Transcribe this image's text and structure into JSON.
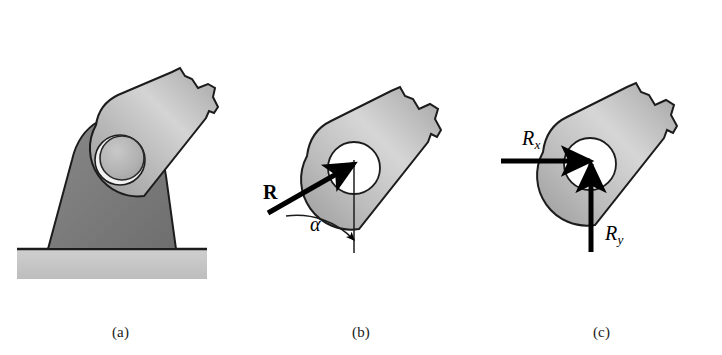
{
  "figure": {
    "background_color": "#ffffff",
    "panels": [
      {
        "id": "a",
        "caption": "(a)",
        "description": "Bar pinned to a bracket mounted on ground",
        "parts": [
          "bar",
          "bracket",
          "pin",
          "ground"
        ]
      },
      {
        "id": "b",
        "caption": "(b)",
        "description": "Free-body diagram of bar with resultant pin reaction R at angle alpha from vertical",
        "parts": [
          "bar",
          "pin-hole",
          "resultant-force-arrow",
          "vertical-reference-line",
          "angle-arc"
        ]
      },
      {
        "id": "c",
        "caption": "(c)",
        "description": "Free-body diagram of bar with rectangular components Rx and Ry of the pin reaction",
        "parts": [
          "bar",
          "pin-hole",
          "rx-arrow",
          "ry-arrow"
        ]
      }
    ]
  },
  "labels": {
    "resultant": "R",
    "angle": "α",
    "component_x_base": "R",
    "component_x_sub": "x",
    "component_y_base": "R",
    "component_y_sub": "y"
  },
  "colors": {
    "bar_light": "#d2d2d2",
    "bar_mid": "#a9a9a9",
    "bar_dark": "#8e8e8e",
    "bracket": "#7d7d7d",
    "ground": "#c8c8c8",
    "outline": "#1c1c1c",
    "arrow": "#000000",
    "hole_white": "#ffffff",
    "pin_face": "#b4b4b4",
    "pin_highlight": "#f0f0f0",
    "caption_text": "#1a1a1a"
  },
  "geometry": {
    "bar_angle_deg": 35,
    "alpha_arc_from": "resultant force line",
    "alpha_arc_to": "vertical reference line"
  }
}
